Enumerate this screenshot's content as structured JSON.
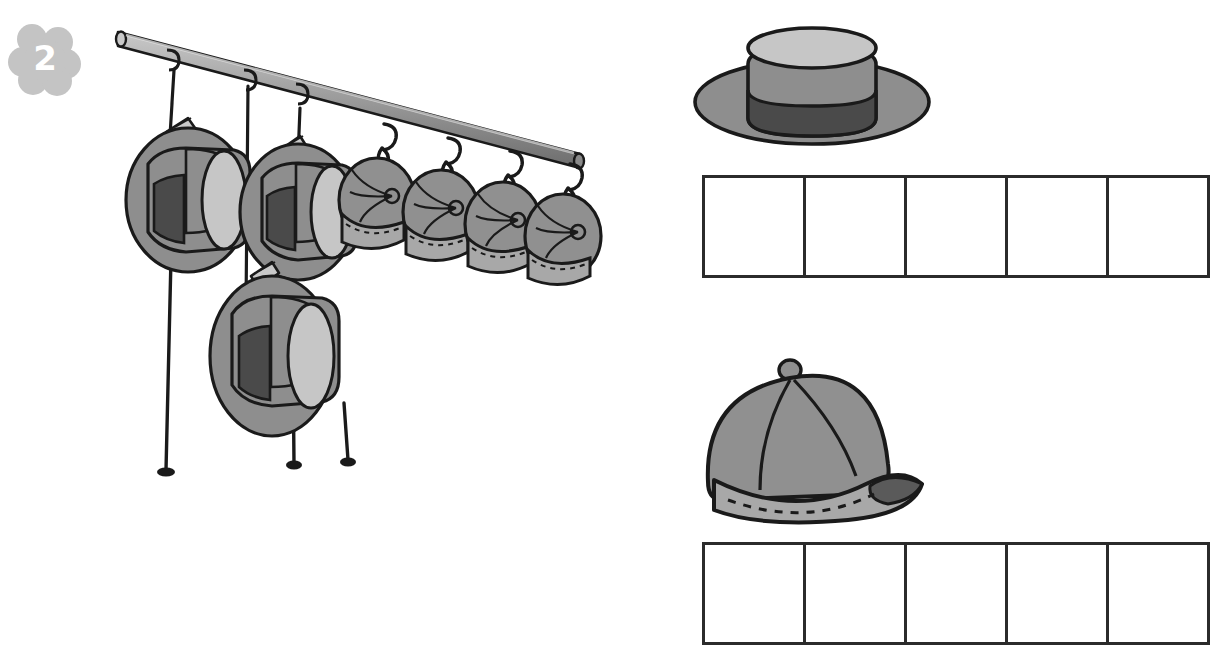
{
  "exercise": {
    "number": "2",
    "badge_shape": "flower",
    "badge_color": "#c4c4c4",
    "badge_number_color": "#ffffff"
  },
  "palette": {
    "outline": "#1a1a1a",
    "grid_line": "#2b2b2b",
    "background": "#ffffff",
    "hat_brim": "#8e8e8e",
    "hat_crown_light": "#c6c6c6",
    "hat_crown_mid": "#8e8e8e",
    "hat_band_dark": "#4a4a4a",
    "cap_body": "#909090",
    "cap_brim": "#a8a8a8",
    "cap_brim_under": "#5a5a5a",
    "rod_light": "#b4b4b4",
    "rod_mid": "#8c8c8c",
    "rod_dark": "#6a6a6a",
    "string": "#1a1a1a"
  },
  "illustration": {
    "name": "hat-rack-illustration",
    "description": "A slanted rod with hats and caps hanging from strings, clothespins and hooks",
    "rod": {
      "name": "hanging-rod",
      "x1": 22,
      "y1": 30,
      "x2": 482,
      "y2": 152,
      "thickness": 13
    },
    "hats": [
      {
        "name": "hat-1",
        "cx": 92,
        "cy": 190,
        "scale": 1.0,
        "string_top_y": 70,
        "string_bottom_y": 462,
        "hanger": "clothespin"
      },
      {
        "name": "hat-2",
        "cx": 196,
        "cy": 198,
        "scale": 0.95,
        "string_top_y": 90,
        "string_bottom_y": 455,
        "hanger": "clothespin"
      },
      {
        "name": "hat-3",
        "cx": 172,
        "cy": 345,
        "scale": 1.0,
        "string_top_y": 95,
        "string_bottom_y": 460,
        "hanger": "clothespin"
      }
    ],
    "caps": [
      {
        "name": "cap-1",
        "cx": 286,
        "cy": 190,
        "scale": 0.62,
        "hook_y": 122
      },
      {
        "name": "cap-2",
        "cx": 350,
        "cy": 198,
        "scale": 0.62,
        "hook_y": 135
      },
      {
        "name": "cap-3",
        "cx": 412,
        "cy": 208,
        "scale": 0.62,
        "hook_y": 147
      },
      {
        "name": "cap-4",
        "cx": 472,
        "cy": 216,
        "scale": 0.62,
        "hook_y": 160
      }
    ],
    "counts": {
      "hats_on_rack": 3,
      "caps_on_rack": 4
    }
  },
  "hat_sample": {
    "name": "hat-sample-image",
    "label": "hat"
  },
  "cap_sample": {
    "name": "cap-sample-image",
    "label": "baseball cap"
  },
  "grids": {
    "hats_row": {
      "name": "hats-answer-grid",
      "cell_count": 5,
      "cells": [
        "",
        "",
        "",
        "",
        ""
      ]
    },
    "caps_row": {
      "name": "caps-answer-grid",
      "cell_count": 5,
      "cells": [
        "",
        "",
        "",
        "",
        ""
      ]
    }
  }
}
